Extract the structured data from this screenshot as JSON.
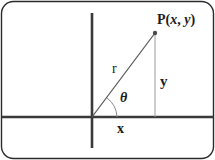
{
  "figure": {
    "name": "polar-coordinates-diagram",
    "background_color": "#ffffff",
    "frame": {
      "stroke_color": "#2b2b2b",
      "corner_radius": 12,
      "stroke_width": 1.4
    },
    "axes": {
      "color": "#3a3a3a",
      "stroke_width": 2.6,
      "origin_x": 92,
      "origin_y": 117,
      "horizontal_from_x": 2,
      "horizontal_to_x": 213,
      "vertical_from_y": 13,
      "vertical_to_y": 148
    },
    "ray": {
      "color": "#555555",
      "stroke_width": 1.2,
      "from_x": 92,
      "from_y": 117,
      "to_x": 155,
      "to_y": 33
    },
    "drop_line": {
      "color": "#9a9a9a",
      "stroke_width": 1,
      "x": 155,
      "from_y": 33,
      "to_y": 117
    },
    "point_marker": {
      "color": "#4a4a4a",
      "x": 155,
      "y": 33,
      "radius": 2.2
    },
    "angle_arc": {
      "color": "#8a8a8a",
      "stroke_width": 1,
      "radius": 25
    },
    "labels": {
      "point": {
        "prefix": "P(",
        "var_x": "x",
        "separator": ", ",
        "var_y": "y",
        "suffix": ")"
      },
      "radius": "r",
      "vertical_leg": "y",
      "horizontal_leg": "x",
      "angle": "θ"
    }
  }
}
